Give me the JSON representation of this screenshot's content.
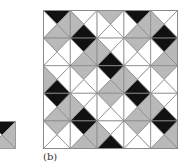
{
  "colors": {
    "black": "#111111",
    "gray": "#b9b9b9",
    "white": "#ffffff",
    "line": "#8a8a8a"
  },
  "tiles": {
    "A": {
      "top": "black",
      "right": "gray",
      "bottom": "gray",
      "left": "white"
    },
    "B": {
      "top": "white",
      "right": "white",
      "bottom": "black",
      "left": "gray"
    },
    "C": {
      "top": "gray",
      "right": "white",
      "bottom": "white",
      "left": "white"
    }
  },
  "single_tile": "A",
  "grid": [
    [
      "A",
      "B",
      "C",
      "A",
      "B"
    ],
    [
      "C",
      "A",
      "B",
      "C",
      "A"
    ],
    [
      "B",
      "C",
      "A",
      "B",
      "C"
    ],
    [
      "A",
      "B",
      "C",
      "A",
      "B"
    ],
    [
      "C",
      "A",
      "B",
      "C",
      "A"
    ]
  ],
  "label": "(b)"
}
